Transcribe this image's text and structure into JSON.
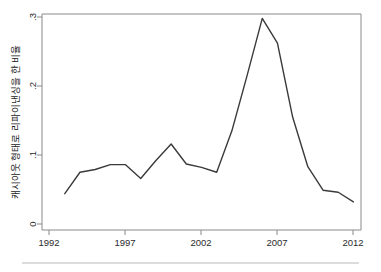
{
  "figure": {
    "background_color": "#ffffff",
    "line_color": "#3a3a3a",
    "axis_color": "#8a8a8a",
    "footer_rule_color": "#b9b9b9"
  },
  "chart_data": {
    "type": "line",
    "title": "",
    "subtitle": "",
    "xlabel": "",
    "ylabel": "캐시아웃 형태로 리파이낸싱을 한 비율",
    "xlim": [
      1991.5,
      2012.5
    ],
    "ylim": [
      0,
      0.3
    ],
    "xtick_labels": [
      "1992",
      "1997",
      "2002",
      "2007",
      "2012"
    ],
    "xtick_values": [
      1992,
      1997,
      2002,
      2007,
      2012
    ],
    "ytick_labels": [
      "0",
      ".1",
      ".2",
      ".3"
    ],
    "ytick_values": [
      0,
      0.1,
      0.2,
      0.3
    ],
    "grid": false,
    "legend": false,
    "legend_position": "none",
    "x": [
      1993,
      1994,
      1995,
      1996,
      1997,
      1998,
      1999,
      2000,
      2001,
      2002,
      2003,
      2004,
      2005,
      2006,
      2007,
      2008,
      2009,
      2010,
      2011,
      2012
    ],
    "series": [
      {
        "name": "캐시아웃 리파이낸싱 비율",
        "values": [
          0.044,
          0.075,
          0.079,
          0.086,
          0.086,
          0.066,
          0.092,
          0.116,
          0.087,
          0.082,
          0.075,
          0.135,
          0.215,
          0.298,
          0.262,
          0.155,
          0.083,
          0.049,
          0.046,
          0.032
        ]
      }
    ]
  },
  "footer": {
    "rule_visible": true
  }
}
